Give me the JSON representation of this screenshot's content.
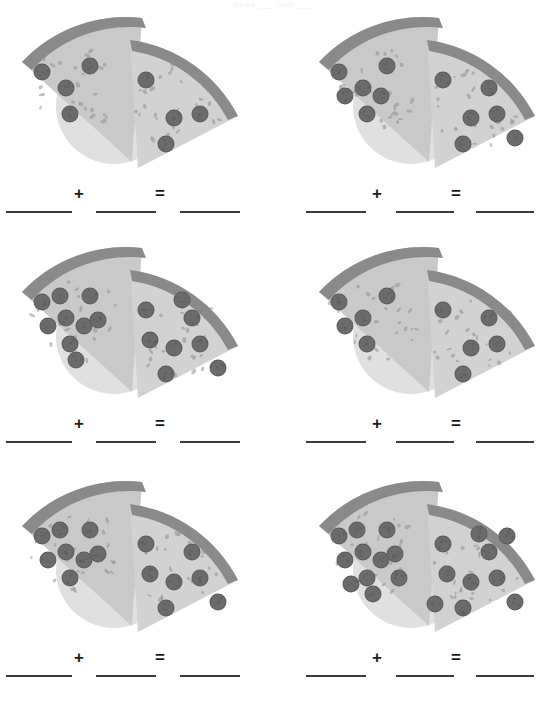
{
  "worksheet": {
    "title": "Pizza Addition Worksheet",
    "header_text": "Name  ___  Date  ___",
    "background_color": "#ffffff",
    "operator_plus": "+",
    "operator_equals": "=",
    "answer_blank": "",
    "palette": {
      "plate": "#e0e0e0",
      "cheese": "#c9c9c9",
      "cheese_light": "#d2d2d2",
      "crust": "#8a8a8a",
      "pepperoni": "#6b6b6b",
      "pepperoni_edge": "#5c5c5c",
      "herb": "#8f8f8f",
      "line": "#3a3a3a",
      "text": "#1d1d1d"
    },
    "problems": [
      {
        "index": 1,
        "row": 0,
        "col": 0,
        "left_slice": {
          "label": "pizza-slice-left",
          "pepperoni_count": 4
        },
        "right_slice": {
          "label": "pizza-slice-right",
          "pepperoni_count": 4
        },
        "sum": 8,
        "blank_left": "",
        "blank_right": "",
        "blank_answer": ""
      },
      {
        "index": 2,
        "row": 0,
        "col": 1,
        "left_slice": {
          "label": "pizza-slice-left",
          "pepperoni_count": 6
        },
        "right_slice": {
          "label": "pizza-slice-right",
          "pepperoni_count": 6
        },
        "sum": 12,
        "blank_left": "",
        "blank_right": "",
        "blank_answer": ""
      },
      {
        "index": 3,
        "row": 1,
        "col": 0,
        "left_slice": {
          "label": "pizza-slice-left",
          "pepperoni_count": 9
        },
        "right_slice": {
          "label": "pizza-slice-right",
          "pepperoni_count": 8
        },
        "sum": 17,
        "blank_left": "",
        "blank_right": "",
        "blank_answer": ""
      },
      {
        "index": 4,
        "row": 1,
        "col": 1,
        "left_slice": {
          "label": "pizza-slice-left",
          "pepperoni_count": 5
        },
        "right_slice": {
          "label": "pizza-slice-right",
          "pepperoni_count": 5
        },
        "sum": 10,
        "blank_left": "",
        "blank_right": "",
        "blank_answer": ""
      },
      {
        "index": 5,
        "row": 2,
        "col": 0,
        "left_slice": {
          "label": "pizza-slice-left",
          "pepperoni_count": 8
        },
        "right_slice": {
          "label": "pizza-slice-right",
          "pepperoni_count": 7
        },
        "sum": 15,
        "blank_left": "",
        "blank_right": "",
        "blank_answer": ""
      },
      {
        "index": 6,
        "row": 2,
        "col": 1,
        "left_slice": {
          "label": "pizza-slice-left",
          "pepperoni_count": 11
        },
        "right_slice": {
          "label": "pizza-slice-right",
          "pepperoni_count": 10
        },
        "sum": 21,
        "blank_left": "",
        "blank_right": "",
        "blank_answer": ""
      }
    ],
    "pepperoni_layout": {
      "left_slice": [
        [
          28,
          62
        ],
        [
          52,
          78
        ],
        [
          76,
          56
        ],
        [
          56,
          104
        ],
        [
          34,
          86
        ],
        [
          70,
          86
        ],
        [
          46,
          56
        ],
        [
          84,
          80
        ],
        [
          62,
          120
        ],
        [
          40,
          110
        ],
        [
          88,
          104
        ]
      ],
      "right_slice": [
        [
          132,
          70
        ],
        [
          160,
          108
        ],
        [
          186,
          104
        ],
        [
          152,
          134
        ],
        [
          178,
          78
        ],
        [
          204,
          128
        ],
        [
          136,
          100
        ],
        [
          168,
          60
        ],
        [
          196,
          62
        ],
        [
          124,
          130
        ],
        [
          208,
          96
        ]
      ]
    }
  }
}
